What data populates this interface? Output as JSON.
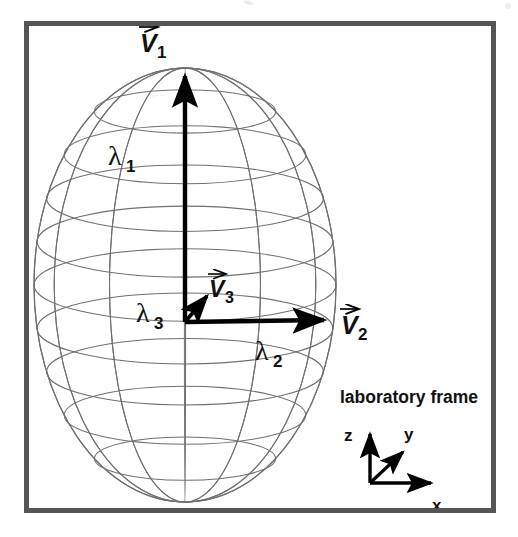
{
  "figure": {
    "title_visible": false,
    "background_color": "#ffffff",
    "frame": {
      "name": "figure-border",
      "x": 24,
      "y": 21,
      "width": 472,
      "height": 492,
      "stroke_color": "#555555",
      "stroke_width": 5
    },
    "ellipsoid": {
      "name": "wireframe-ellipsoid",
      "center_x": 185,
      "center_y": 285,
      "semi_axis_x": 151,
      "semi_axis_y": 217,
      "stroke_color": "#777777",
      "latitude_lines": 9,
      "longitude_lines": 12,
      "fill": "none"
    },
    "vectors": [
      {
        "id": "v1",
        "label": "V",
        "subscript": "1",
        "label_x": 143,
        "label_y": 46,
        "arrow": {
          "x1": 185,
          "y1": 322,
          "x2": 185,
          "y2": 68
        },
        "color": "#000000",
        "description": "major-principal-axis-vector-up"
      },
      {
        "id": "v2",
        "label": "V",
        "subscript": "2",
        "label_x": 344,
        "label_y": 330,
        "arrow": {
          "x1": 185,
          "y1": 322,
          "x2": 331,
          "y2": 320
        },
        "color": "#000000",
        "description": "second-principal-axis-vector-right"
      },
      {
        "id": "v3",
        "label": "V",
        "subscript": "3",
        "label_x": 212,
        "label_y": 292,
        "arrow": {
          "x1": 185,
          "y1": 322,
          "x2": 212,
          "y2": 290
        },
        "color": "#000000",
        "description": "third-principal-axis-vector-diagonal"
      }
    ],
    "eigenvalues": [
      {
        "id": "lambda1",
        "symbol": "λ",
        "subscript": "1",
        "x": 113,
        "y": 160
      },
      {
        "id": "lambda3",
        "symbol": "λ",
        "subscript": "3",
        "x": 141,
        "y": 318
      },
      {
        "id": "lambda2",
        "symbol": "λ",
        "subscript": "2",
        "x": 259,
        "y": 358
      }
    ],
    "laboratory_frame": {
      "name": "laboratory-frame-legend",
      "caption": "laboratory frame",
      "caption_x": 340,
      "caption_y": 400,
      "origin_x": 370,
      "origin_y": 483,
      "axes": [
        {
          "id": "z",
          "label": "z",
          "x2": 370,
          "y2": 427,
          "label_x": 348,
          "label_y": 438
        },
        {
          "id": "y",
          "label": "y",
          "x2": 409,
          "y2": 447,
          "label_x": 408,
          "label_y": 437
        },
        {
          "id": "x",
          "label": "x",
          "x2": 438,
          "y2": 483,
          "label_x": 436,
          "label_y": 508
        }
      ],
      "color": "#000000"
    }
  }
}
